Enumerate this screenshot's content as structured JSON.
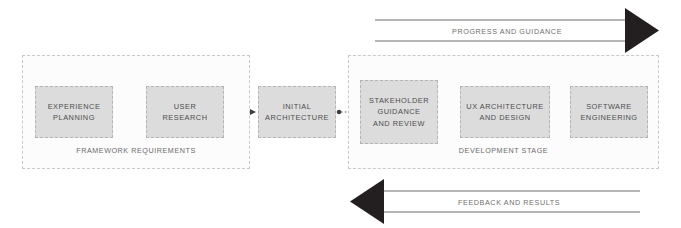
{
  "diagram": {
    "colors": {
      "node_fill": "#dcdcdc",
      "node_border": "#b4b4b4",
      "group_border": "#c9c9c9",
      "group_fill": "#fcfcfc",
      "text": "#4d4d4d",
      "label_text": "#6a6a6a",
      "arrow_dark": "#231f20",
      "arrow_line": "#6f6f6f",
      "connector": "#555555",
      "background": "#ffffff"
    }
  },
  "groups": [
    {
      "id": "framework",
      "label": "FRAMEWORK REQUIREMENTS"
    },
    {
      "id": "development",
      "label": "DEVELOPMENT STAGE"
    }
  ],
  "nodes": [
    {
      "id": "experience-planning",
      "label": "EXPERIENCE\nPLANNING",
      "group": "framework"
    },
    {
      "id": "user-research",
      "label": "USER\nRESEARCH",
      "group": "framework"
    },
    {
      "id": "initial-architecture",
      "label": "INITIAL\nARCHITECTURE",
      "group": "none"
    },
    {
      "id": "stakeholder-guidance",
      "label": "STAKEHOLDER\nGUIDANCE\nAND REVIEW",
      "group": "development"
    },
    {
      "id": "ux-architecture",
      "label": "UX ARCHITECTURE\nAND DESIGN",
      "group": "development"
    },
    {
      "id": "software-engineering",
      "label": "SOFTWARE\nENGINEERING",
      "group": "development"
    }
  ],
  "flow_arrows": [
    {
      "id": "progress",
      "label": "PROGRESS AND GUIDANCE",
      "direction": "right"
    },
    {
      "id": "feedback",
      "label": "FEEDBACK AND RESULTS",
      "direction": "left"
    }
  ],
  "connectors": [
    {
      "from": "experience-planning",
      "to": "user-research",
      "style": "dotted-straight"
    },
    {
      "from": "user-research",
      "to": "initial-architecture",
      "style": "dotted-straight"
    },
    {
      "from": "initial-architecture",
      "to": "stakeholder-guidance",
      "style": "dotted-straight"
    },
    {
      "from": "stakeholder-guidance",
      "to": "ux-architecture",
      "style": "dotted-arc-top"
    },
    {
      "from": "ux-architecture",
      "to": "software-engineering",
      "style": "dotted-arc-top"
    },
    {
      "from": "stakeholder-guidance",
      "to": "software-engineering",
      "style": "dotted-arc-top-long"
    },
    {
      "from": "software-engineering",
      "to": "ux-architecture",
      "style": "dotted-arc-bottom"
    },
    {
      "from": "ux-architecture",
      "to": "stakeholder-guidance",
      "style": "dotted-arc-bottom"
    },
    {
      "from": "software-engineering",
      "to": "stakeholder-guidance",
      "style": "dotted-arc-bottom-long"
    }
  ]
}
